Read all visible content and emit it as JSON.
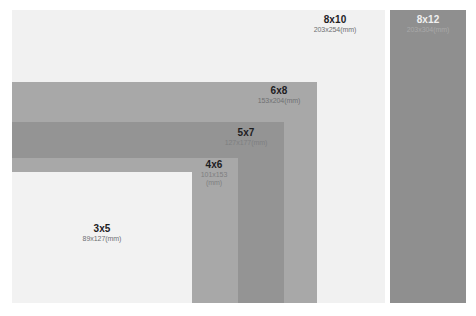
{
  "canvas": {
    "width": 476,
    "height": 316,
    "background": "#ffffff"
  },
  "chart_data": {
    "type": "bar",
    "subtitle": "",
    "xlabel": "",
    "ylabel": "",
    "units": "mm",
    "layout": "nested corner-aligned rectangles, bottom-left anchored",
    "legend": "none (inline labels)",
    "grid": false,
    "categories": [
      "3x5",
      "4x6",
      "5x7",
      "6x8",
      "8x10",
      "8x12"
    ],
    "series": [
      {
        "name": "width_mm",
        "values": [
          89,
          101,
          127,
          153,
          203,
          203
        ]
      },
      {
        "name": "height_mm",
        "values": [
          127,
          153,
          177,
          204,
          254,
          304
        ]
      }
    ],
    "annotations": [
      "3x5 89x127(mm)",
      "4x6 101x153 (mm)",
      "5x7 127x177(mm)",
      "6x8 153x204(mm)",
      "8x10 203x254(mm)",
      "8x12 203x304(mm)"
    ]
  },
  "rects": [
    {
      "id": "8x10",
      "name": "rect-8x10",
      "size_label": "8x10",
      "dims_label": "203x254(mm)",
      "dims_label2": "",
      "color": "#f1f1f1",
      "x": 12,
      "y": 10,
      "w": 373,
      "h": 293,
      "label_x": 297,
      "label_y": 14,
      "label_w": 76,
      "text_theme": "t-dark"
    },
    {
      "id": "8x12",
      "name": "rect-8x12",
      "size_label": "8x12",
      "dims_label": "203x304(mm)",
      "dims_label2": "",
      "color": "#8f8f8f",
      "x": 390,
      "y": 10,
      "w": 76,
      "h": 293,
      "label_x": 390,
      "label_y": 14,
      "label_w": 76,
      "text_theme": "t-light"
    },
    {
      "id": "6x8",
      "name": "rect-6x8",
      "size_label": "6x8",
      "dims_label": "153x204(mm)",
      "dims_label2": "",
      "color": "#a8a8a8",
      "x": 12,
      "y": 82,
      "w": 305,
      "h": 221,
      "label_x": 241,
      "label_y": 85,
      "label_w": 76,
      "text_theme": "t-dark"
    },
    {
      "id": "5x7",
      "name": "rect-5x7",
      "size_label": "5x7",
      "dims_label": "127x177(mm)",
      "dims_label2": "",
      "color": "#949494",
      "x": 12,
      "y": 122,
      "w": 272,
      "h": 181,
      "label_x": 208,
      "label_y": 127,
      "label_w": 76,
      "text_theme": "t-mid"
    },
    {
      "id": "4x6",
      "name": "rect-4x6",
      "size_label": "4x6",
      "dims_label": "101x153",
      "dims_label2": "(mm)",
      "color": "#a8a8a8",
      "x": 12,
      "y": 158,
      "w": 226,
      "h": 145,
      "label_x": 190,
      "label_y": 159,
      "label_w": 48,
      "text_theme": "t-mid"
    },
    {
      "id": "3x5",
      "name": "rect-3x5",
      "size_label": "3x5",
      "dims_label": "89x127(mm)",
      "dims_label2": "",
      "color": "#f2f2f2",
      "x": 12,
      "y": 172,
      "w": 180,
      "h": 131,
      "label_x": 64,
      "label_y": 223,
      "label_w": 76,
      "text_theme": "t-dark"
    }
  ]
}
